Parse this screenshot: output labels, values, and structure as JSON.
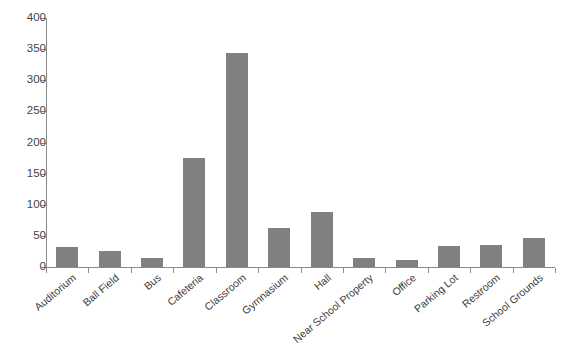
{
  "chart_data": {
    "type": "bar",
    "title": "",
    "subtitle": "",
    "xlabel": "",
    "ylabel": "",
    "ylim": [
      0,
      400
    ],
    "ytick_step": 50,
    "yticks": [
      0,
      50,
      100,
      150,
      200,
      250,
      300,
      350,
      400
    ],
    "grid": false,
    "legend": null,
    "bar_color": "#808080",
    "axis_color": "#8a8a8a",
    "text_color": "#3a3a3a",
    "categories": [
      "Auditorium",
      "Ball Field",
      "Bus",
      "Cafeteria",
      "Classroom",
      "Gymnasium",
      "Hall",
      "Near School Property",
      "Office",
      "Parking Lot",
      "Restroom",
      "School Grounds"
    ],
    "values": [
      32,
      25,
      15,
      175,
      343,
      62,
      88,
      15,
      11,
      34,
      36,
      46
    ]
  }
}
